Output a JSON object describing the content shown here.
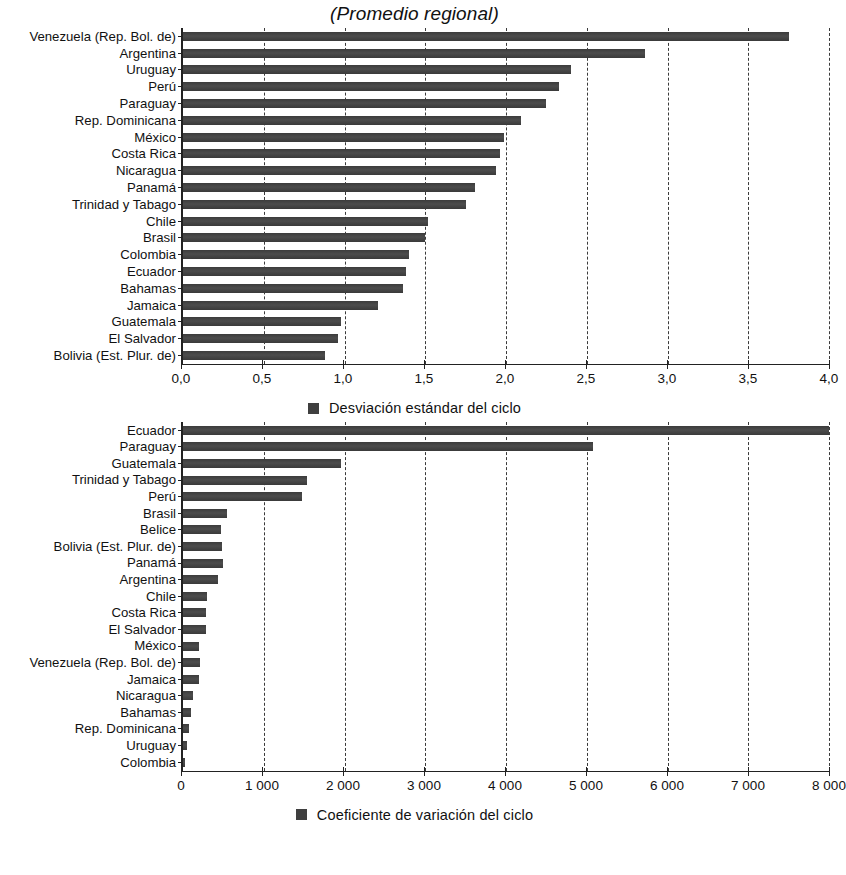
{
  "title": "(Promedio regional)",
  "colors": {
    "bar": "#444444",
    "axis": "#222222",
    "grid": "#3a3a3a",
    "text": "#111111"
  },
  "panel1": {
    "legend_label": "Desviación estándar del ciclo",
    "axis_ticks": [
      "0,0",
      "0,5",
      "1,0",
      "1,5",
      "2,0",
      "2,5",
      "3,0",
      "3,5",
      "4,0"
    ]
  },
  "panel2": {
    "legend_label": "Coeficiente de variación del ciclo",
    "axis_ticks": [
      "0",
      "1 000",
      "2 000",
      "3 000",
      "4 000",
      "5 000",
      "6 000",
      "7 000",
      "8 000"
    ]
  },
  "chart_data": [
    {
      "type": "bar",
      "orientation": "horizontal",
      "title": "(Promedio regional)",
      "xlabel": "",
      "ylabel": "",
      "xlim": [
        0,
        4
      ],
      "xticks": [
        0,
        0.5,
        1,
        1.5,
        2,
        2.5,
        3,
        3.5,
        4
      ],
      "xtick_labels": [
        "0,0",
        "0,5",
        "1,0",
        "1,5",
        "2,0",
        "2,5",
        "3,0",
        "3,5",
        "4,0"
      ],
      "grid": true,
      "legend": [
        "Desviación estándar del ciclo"
      ],
      "legend_position": "bottom-center",
      "categories": [
        "Venezuela (Rep. Bol. de)",
        "Argentina",
        "Uruguay",
        "Perú",
        "Paraguay",
        "Rep. Dominicana",
        "México",
        "Costa Rica",
        "Nicaragua",
        "Panamá",
        "Trinidad y Tabago",
        "Chile",
        "Brasil",
        "Colombia",
        "Ecuador",
        "Bahamas",
        "Jamaica",
        "Guatemala",
        "El Salvador",
        "Bolivia (Est. Plur. de)"
      ],
      "values": [
        3.75,
        2.86,
        2.4,
        2.33,
        2.25,
        2.09,
        1.99,
        1.96,
        1.94,
        1.81,
        1.75,
        1.52,
        1.5,
        1.4,
        1.38,
        1.36,
        1.21,
        0.98,
        0.96,
        0.88
      ]
    },
    {
      "type": "bar",
      "orientation": "horizontal",
      "title": "",
      "xlabel": "",
      "ylabel": "",
      "xlim": [
        0,
        8000
      ],
      "xticks": [
        0,
        1000,
        2000,
        3000,
        4000,
        5000,
        6000,
        7000,
        8000
      ],
      "xtick_labels": [
        "0",
        "1 000",
        "2 000",
        "3 000",
        "4 000",
        "5 000",
        "6 000",
        "7 000",
        "8 000"
      ],
      "grid": true,
      "legend": [
        "Coeficiente de variación del ciclo"
      ],
      "legend_position": "bottom-center",
      "categories": [
        "Ecuador",
        "Paraguay",
        "Guatemala",
        "Trinidad y Tabago",
        "Perú",
        "Brasil",
        "Belice",
        "Bolivia (Est. Plur. de)",
        "Panamá",
        "Argentina",
        "Chile",
        "Costa Rica",
        "El Salvador",
        "México",
        "Venezuela (Rep. Bol. de)",
        "Jamaica",
        "Nicaragua",
        "Bahamas",
        "Rep. Dominicana",
        "Uruguay",
        "Colombia"
      ],
      "values": [
        8000,
        5080,
        1960,
        1530,
        1470,
        550,
        470,
        480,
        490,
        430,
        300,
        280,
        280,
        200,
        210,
        200,
        130,
        105,
        70,
        55,
        15
      ]
    }
  ]
}
